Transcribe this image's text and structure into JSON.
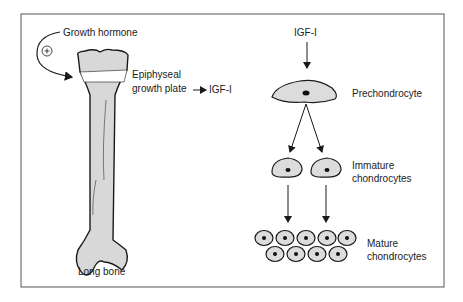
{
  "labels": {
    "growth_hormone": "Growth hormone",
    "plus_sign": "+",
    "epiphyseal_1": "Epiphyseal",
    "epiphyseal_2": "growth plate",
    "igf_left": "IGF-I",
    "long_bone": "Long bone",
    "igf_top": "IGF-I",
    "prechondrocyte": "Prechondrocyte",
    "immature_1": "Immature",
    "immature_2": "chondrocytes",
    "mature_1": "Mature",
    "mature_2": "chondrocytes"
  },
  "colors": {
    "bone_fill": "#d8d8d8",
    "cell_fill": "#dcdcdc",
    "stroke": "#1a1a1a",
    "frame": "#555555"
  }
}
